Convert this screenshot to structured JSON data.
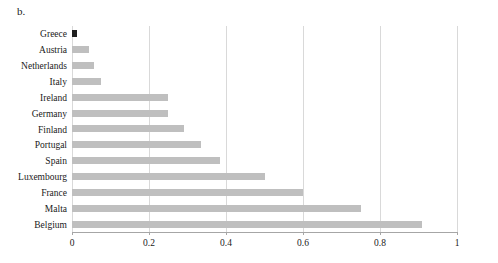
{
  "figure": {
    "panel_label": "b.",
    "bar_color": "#bfbfbf",
    "highlight_bar_color": "#1f1f1f",
    "gridline_color": "#d9d9d9",
    "axis_color": "#a6a6a6"
  },
  "chart_data": {
    "type": "bar",
    "orientation": "horizontal",
    "title": "",
    "subtitle": "",
    "xlabel": "",
    "ylabel": "",
    "xlim": [
      0,
      1
    ],
    "xticks": [
      0,
      0.2,
      0.4,
      0.6,
      0.8,
      1
    ],
    "xtick_labels": [
      "0",
      "0.2",
      "0.4",
      "0.6",
      "0.8",
      "1"
    ],
    "grid": true,
    "grid_axis": "x",
    "legend": false,
    "legend_position": "none",
    "annotations": [
      "b."
    ],
    "categories": [
      "Greece",
      "Austria",
      "Netherlands",
      "Italy",
      "Ireland",
      "Germany",
      "Finland",
      "Portugal",
      "Spain",
      "Luxembourg",
      "France",
      "Malta",
      "Belgium"
    ],
    "values": [
      0.012,
      0.045,
      0.058,
      0.075,
      0.25,
      0.25,
      0.29,
      0.335,
      0.385,
      0.5,
      0.6,
      0.75,
      0.91
    ],
    "bar_colors": [
      "#1f1f1f",
      "#bfbfbf",
      "#bfbfbf",
      "#bfbfbf",
      "#bfbfbf",
      "#bfbfbf",
      "#bfbfbf",
      "#bfbfbf",
      "#bfbfbf",
      "#bfbfbf",
      "#bfbfbf",
      "#bfbfbf",
      "#bfbfbf"
    ]
  }
}
